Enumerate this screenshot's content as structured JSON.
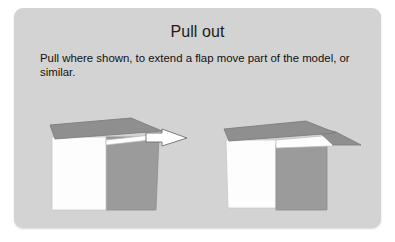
{
  "card": {
    "title": "Pull out",
    "body": "Pull where shown, to extend a flap move part of the model, or similar.",
    "background_color": "#d3d3d3",
    "corner_radius_px": 9
  },
  "palette": {
    "page_background": "#ffffff",
    "card_background": "#d3d3d3",
    "flap_top_gray": "#8f8f8f",
    "face_side_gray": "#9b9b9b",
    "face_front_white": "#fdfdfd",
    "outline": "#8a8a8a",
    "arrow_fill": "#ffffff",
    "arrow_outline": "#6f6f6f",
    "text_color": "#111111"
  },
  "figures": [
    {
      "id": "before",
      "label": "model-before-pull",
      "caption": "",
      "has_arrow": true,
      "arrow": {
        "name": "pull-direction-arrow",
        "direction": "right",
        "color": "#ffffff"
      }
    },
    {
      "id": "after",
      "label": "model-after-pull",
      "caption": "",
      "has_arrow": false
    }
  ]
}
